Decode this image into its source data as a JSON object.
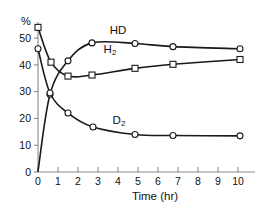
{
  "chart_data": {
    "type": "line",
    "title": "",
    "xlabel": "Time (hr)",
    "ylabel": "%",
    "xlim": [
      0,
      10.6
    ],
    "ylim": [
      0,
      56
    ],
    "xticks": [
      "0",
      "1",
      "2",
      "3",
      "4",
      "5",
      "6",
      "7",
      "8",
      "9",
      "10"
    ],
    "yticks": [
      "0",
      "10",
      "20",
      "30",
      "40",
      "50"
    ],
    "grid": false,
    "legend_position": "inline-annotations",
    "series": [
      {
        "name": "HD",
        "label": "HD",
        "marker": "circle",
        "x": [
          0,
          0.6,
          1.5,
          2.7,
          4.85,
          6.75,
          10.1
        ],
        "y": [
          0.3,
          29.0,
          41.5,
          48.2,
          48.0,
          46.8,
          46.0
        ]
      },
      {
        "name": "H2",
        "label": "H",
        "label_sub": "2",
        "marker": "square",
        "x": [
          0,
          0.65,
          1.5,
          2.7,
          4.85,
          6.75,
          10.1
        ],
        "y": [
          54.0,
          41.0,
          35.8,
          36.2,
          38.7,
          40.2,
          42.0
        ]
      },
      {
        "name": "D2",
        "label": "D",
        "label_sub": "2",
        "marker": "circle",
        "x": [
          0,
          0.6,
          1.5,
          2.75,
          4.85,
          6.75,
          10.1
        ],
        "y": [
          46.0,
          29.5,
          22.0,
          16.8,
          14.0,
          13.6,
          13.5
        ]
      }
    ],
    "annotations": [
      {
        "text": "HD",
        "x": 4.0,
        "y": 51.5
      },
      {
        "text": "H",
        "sub": "2",
        "x": 3.6,
        "y": 44.5
      },
      {
        "text": "D",
        "sub": "2",
        "x": 4.05,
        "y": 18.0
      }
    ]
  }
}
